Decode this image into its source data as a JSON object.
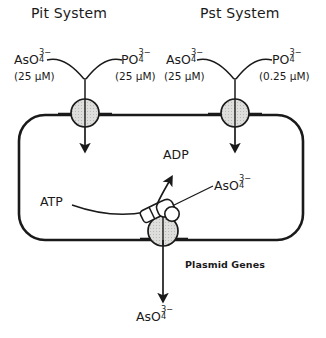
{
  "diagram": {
    "systems": [
      {
        "title": "Pit System"
      },
      {
        "title": "Pst System"
      }
    ],
    "pit": {
      "arsenate": {
        "formula": "AsO",
        "sub": "4",
        "sup": "3−",
        "concentration": "(25 μM)"
      },
      "phosphate": {
        "formula": "PO",
        "sub": "4",
        "sup": "3−",
        "concentration": "(25 μM)"
      }
    },
    "pst": {
      "arsenate": {
        "formula": "AsO",
        "sub": "4",
        "sup": "3−",
        "concentration": "(25 μM)"
      },
      "phosphate": {
        "formula": "PO",
        "sub": "4",
        "sup": "3−",
        "concentration": "(0.25 μM)"
      }
    },
    "interior": {
      "atp_label": "ATP",
      "adp_label": "ADP",
      "pumped_arsenate": {
        "formula": "AsO",
        "sub": "4",
        "sup": "3−"
      },
      "plasmid_label": "Plasmid Genes"
    },
    "efflux": {
      "exported_arsenate": {
        "formula": "AsO",
        "sub": "4",
        "sup": "3−"
      }
    },
    "colors": {
      "stroke": "#1a1a1a",
      "transporter_fill": "#dededc",
      "membrane": "#1a1a1a",
      "background": "#ffffff"
    }
  }
}
